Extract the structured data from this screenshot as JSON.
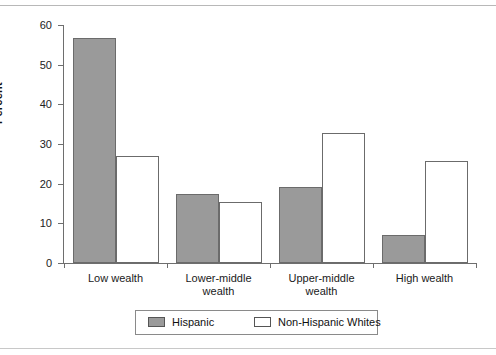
{
  "chart_data": {
    "type": "bar",
    "title": "",
    "xlabel": "",
    "ylabel": "Percent",
    "ylim": [
      0,
      60
    ],
    "yticks": [
      0,
      10,
      20,
      30,
      40,
      50,
      60
    ],
    "ytick_labels": [
      "0",
      "10",
      "20",
      "30",
      "40",
      "50",
      "60"
    ],
    "grid": false,
    "legend_position": "bottom",
    "categories": [
      "Low wealth",
      "Lower-middle\nwealth",
      "Upper-middle\nwealth",
      "High wealth"
    ],
    "series": [
      {
        "name": "Hispanic",
        "color": "#9a9a9a",
        "values": [
          56.8,
          17.5,
          19.2,
          7.0
        ]
      },
      {
        "name": "Non-Hispanic Whites",
        "color": "#ffffff",
        "values": [
          27.0,
          15.5,
          32.8,
          25.6
        ]
      }
    ]
  },
  "legend": {
    "items": [
      {
        "label": "Hispanic",
        "swatch": "hispanic"
      },
      {
        "label": "Non-Hispanic Whites",
        "swatch": "nhw"
      }
    ]
  },
  "colors": {
    "hispanic_fill": "#9a9a9a",
    "nhw_fill": "#ffffff",
    "bar_outline": "#6b6b6b",
    "axis": "#6e6e6e",
    "frame": "#b8b8b8",
    "background": "#ffffff"
  }
}
